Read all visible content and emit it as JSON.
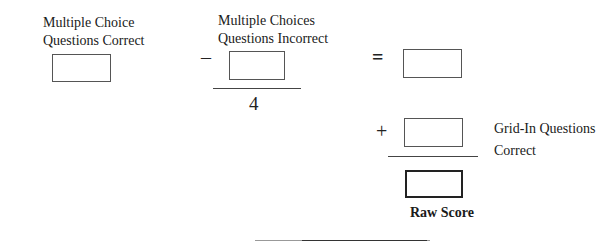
{
  "col1": {
    "label_line1": "Multiple Choice",
    "label_line2": "Questions Correct"
  },
  "col2": {
    "label_line1": "Multiple Choices",
    "label_line2": "Questions Incorrect",
    "operator": "–",
    "divisor": "4"
  },
  "col3": {
    "equals": "=",
    "plus": "+",
    "grid_in_line1": "Grid-In Questions",
    "grid_in_line2": "Correct",
    "raw_score_label": "Raw Score"
  }
}
